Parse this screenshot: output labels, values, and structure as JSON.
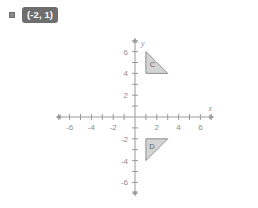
{
  "answer": {
    "bullet_icon": "square-bullet-icon",
    "badge_text": "(-2, 1)",
    "badge_color": "#6e6e6e",
    "badge_text_color": "#ffffff"
  },
  "chart_data": {
    "type": "scatter",
    "title": "",
    "xlabel": "x",
    "ylabel": "y",
    "xlim": [
      -7,
      7
    ],
    "ylim": [
      -7,
      7
    ],
    "grid": false,
    "axis_color": "#9a9a9a",
    "tick_step": 1,
    "x_tick_labels": [
      "-6",
      "-4",
      "-2",
      "2",
      "4",
      "6"
    ],
    "x_tick_values": [
      -6,
      -4,
      -2,
      2,
      4,
      6
    ],
    "y_tick_labels": [
      "6",
      "4",
      "2",
      "-2",
      "-4",
      "-6"
    ],
    "y_tick_values": [
      6,
      4,
      2,
      -2,
      -4,
      -6
    ],
    "shapes": [
      {
        "name": "C",
        "label": "C",
        "fill": "#cccccc",
        "stroke": "#8e8e8e",
        "vertices": [
          [
            1,
            6
          ],
          [
            1,
            4
          ],
          [
            3,
            4
          ]
        ],
        "label_point": [
          1.6,
          4.8
        ]
      },
      {
        "name": "D",
        "label": "D",
        "fill": "#cccccc",
        "stroke": "#8e8e8e",
        "vertices": [
          [
            1,
            -2
          ],
          [
            3,
            -2
          ],
          [
            1,
            -4
          ]
        ],
        "label_point": [
          1.55,
          -2.75
        ]
      }
    ]
  }
}
